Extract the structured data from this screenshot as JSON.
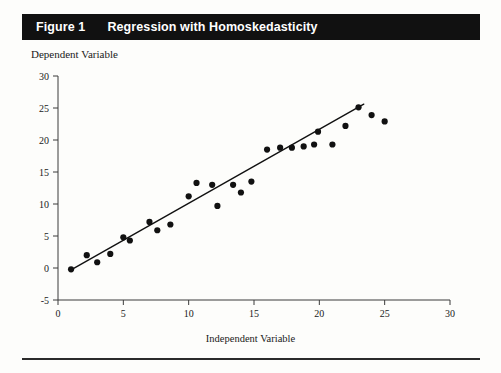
{
  "figure": {
    "number_label": "Figure 1",
    "title": "Regression with Homoskedasticity"
  },
  "chart_data": {
    "type": "scatter",
    "title": "Regression with Homoskedasticity",
    "xlabel": "Independent Variable",
    "ylabel": "Dependent Variable",
    "xlim": [
      0,
      30
    ],
    "ylim": [
      -5,
      30
    ],
    "xticks": [
      0,
      5,
      10,
      15,
      20,
      25,
      30
    ],
    "yticks": [
      -5,
      0,
      5,
      10,
      15,
      20,
      25,
      30
    ],
    "grid": false,
    "legend": null,
    "series": [
      {
        "name": "Observations",
        "marker": "filled-circle",
        "color": "#111111",
        "points": [
          [
            1.0,
            -0.2
          ],
          [
            2.2,
            2.0
          ],
          [
            3.0,
            0.9
          ],
          [
            4.0,
            2.2
          ],
          [
            5.0,
            4.8
          ],
          [
            5.5,
            4.3
          ],
          [
            7.0,
            7.2
          ],
          [
            7.6,
            5.9
          ],
          [
            8.6,
            6.8
          ],
          [
            10.0,
            11.2
          ],
          [
            10.6,
            13.3
          ],
          [
            11.8,
            13.0
          ],
          [
            12.2,
            9.7
          ],
          [
            13.4,
            13.0
          ],
          [
            14.0,
            11.8
          ],
          [
            14.8,
            13.5
          ],
          [
            16.0,
            18.5
          ],
          [
            17.0,
            18.8
          ],
          [
            17.9,
            18.8
          ],
          [
            18.8,
            19.0
          ],
          [
            19.6,
            19.3
          ],
          [
            19.9,
            21.3
          ],
          [
            21.0,
            19.3
          ],
          [
            22.0,
            22.2
          ],
          [
            23.0,
            25.1
          ],
          [
            24.0,
            23.9
          ],
          [
            25.0,
            22.9
          ]
        ]
      },
      {
        "name": "Fitted regression line",
        "type": "line",
        "color": "#111111",
        "endpoints": [
          [
            1.0,
            -0.3
          ],
          [
            23.4,
            25.6
          ]
        ]
      }
    ]
  }
}
